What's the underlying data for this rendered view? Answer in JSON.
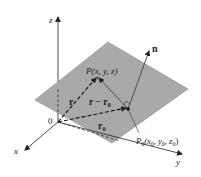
{
  "diagram": {
    "colors": {
      "plane": "#a9a9a9",
      "plane_edge": "#8a8a8a",
      "ink": "#222222",
      "background": "#ffffff"
    },
    "axes": {
      "z_label": "z",
      "x_label": "x",
      "y_label": "y",
      "origin_label": "0"
    },
    "points": {
      "P_name": "P",
      "P_coords": "(x, y, z)",
      "P0_name": "P",
      "P0_sub": "0",
      "P0_coords_open": "(x",
      "P0_coords_y": ", y",
      "P0_coords_z": ", z",
      "P0_coords_close": ")",
      "sub0": "0"
    },
    "vectors": {
      "n": "n",
      "r": "r",
      "r_minus": "r − r",
      "r0": "r",
      "sub0": "0"
    }
  }
}
